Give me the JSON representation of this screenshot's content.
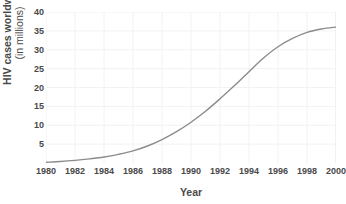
{
  "chart_data": {
    "type": "line",
    "title": "",
    "xlabel": "Year",
    "ylabel": "HIV cases worldwide (in millions)",
    "ylabel_line1": "HIV cases worldwide",
    "ylabel_line2": "(in millions)",
    "xlim": [
      1980,
      2000
    ],
    "ylim": [
      0,
      40
    ],
    "xticks": [
      1980,
      1982,
      1984,
      1986,
      1988,
      1990,
      1992,
      1994,
      1996,
      1998,
      2000
    ],
    "xtick_labels": [
      "1980",
      "1982",
      "1984",
      "1986",
      "1988",
      "1990",
      "1992",
      "1994",
      "1996",
      "1998",
      "2000"
    ],
    "yticks": [
      5,
      10,
      15,
      20,
      25,
      30,
      35,
      40
    ],
    "ytick_labels": [
      "5",
      "10",
      "15",
      "20",
      "25",
      "30",
      "35",
      "40"
    ],
    "grid": true,
    "legend": "none",
    "line_color": "#8c8c8c",
    "grid_color": "#f2f2f2",
    "text_color": "#4a4a4a",
    "series": [
      {
        "name": "HIV cases worldwide",
        "x": [
          1980,
          1981,
          1982,
          1983,
          1984,
          1985,
          1986,
          1987,
          1988,
          1989,
          1990,
          1991,
          1992,
          1993,
          1994,
          1995,
          1996,
          1997,
          1998,
          1999,
          2000
        ],
        "values": [
          0.2,
          0.4,
          0.7,
          1.1,
          1.6,
          2.3,
          3.2,
          4.5,
          6.2,
          8.3,
          10.8,
          13.7,
          17.0,
          20.5,
          24.2,
          27.8,
          30.8,
          33.0,
          34.6,
          35.5,
          36.0
        ]
      }
    ]
  }
}
